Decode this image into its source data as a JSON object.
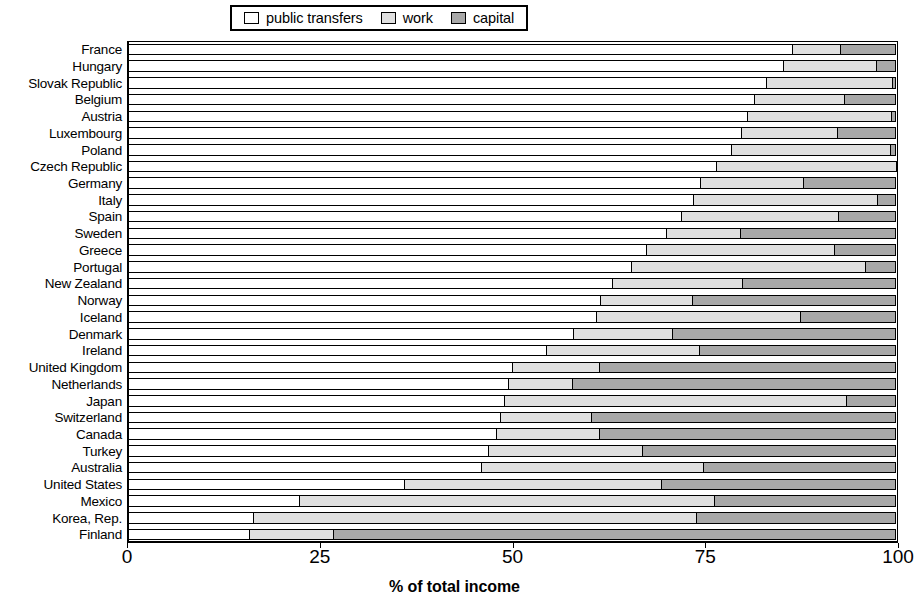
{
  "legend": {
    "entries": [
      {
        "label": "public transfers",
        "color": "#ffffff",
        "icon": "square-swatch"
      },
      {
        "label": "work",
        "color": "#e0e0e0",
        "icon": "square-swatch"
      },
      {
        "label": "capital",
        "color": "#a8a8a8",
        "icon": "square-swatch"
      }
    ]
  },
  "axis": {
    "x_title": "% of total income",
    "x_ticks": [
      "0",
      "25",
      "50",
      "75",
      "100"
    ]
  },
  "chart_data": {
    "type": "bar",
    "orientation": "horizontal",
    "stacked": true,
    "title": "",
    "xlabel": "% of total income",
    "ylabel": "",
    "xlim": [
      0,
      100
    ],
    "grid": false,
    "legend_position": "top-center",
    "categories": [
      "France",
      "Hungary",
      "Slovak Republic",
      "Belgium",
      "Austria",
      "Luxembourg",
      "Poland",
      "Czech Republic",
      "Germany",
      "Italy",
      "Spain",
      "Sweden",
      "Greece",
      "Portugal",
      "New Zealand",
      "Norway",
      "Iceland",
      "Denmark",
      "Ireland",
      "United Kingdom",
      "Netherlands",
      "Japan",
      "Switzerland",
      "Canada",
      "Turkey",
      "Australia",
      "United States",
      "Mexico",
      "Korea, Rep.",
      "Finland"
    ],
    "series": [
      {
        "name": "public transfers",
        "color": "#ffffff",
        "values": [
          86.4,
          85.2,
          83.0,
          81.5,
          80.5,
          79.8,
          78.5,
          76.5,
          74.5,
          73.5,
          72.0,
          70.0,
          67.5,
          65.5,
          63.0,
          61.5,
          61.0,
          58.0,
          54.5,
          50.0,
          49.5,
          49.0,
          48.5,
          48.0,
          47.0,
          46.0,
          36.0,
          22.4,
          16.5,
          16.0
        ]
      },
      {
        "name": "work",
        "color": "#e0e0e0",
        "values": [
          6.3,
          12.2,
          16.5,
          11.8,
          18.8,
          12.5,
          20.7,
          23.5,
          13.5,
          24.0,
          20.5,
          9.8,
          24.5,
          30.5,
          17.0,
          12.0,
          26.5,
          13.0,
          20.0,
          11.5,
          8.5,
          44.5,
          12.0,
          13.5,
          20.0,
          29.0,
          33.5,
          54.0,
          57.5,
          11.0
        ]
      },
      {
        "name": "capital",
        "color": "#a8a8a8",
        "values": [
          7.3,
          2.6,
          0.5,
          6.7,
          0.7,
          7.7,
          0.8,
          0.0,
          12.0,
          2.5,
          7.5,
          20.2,
          8.0,
          4.0,
          20.0,
          26.5,
          12.5,
          29.0,
          25.5,
          38.5,
          42.0,
          6.5,
          39.5,
          38.5,
          33.0,
          25.0,
          30.5,
          23.6,
          26.0,
          73.0
        ]
      }
    ]
  }
}
